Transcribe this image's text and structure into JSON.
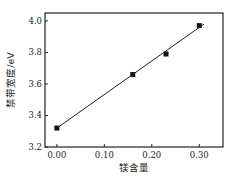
{
  "chart_data": {
    "type": "scatter",
    "title": "",
    "xlabel": "镁含量",
    "ylabel": "禁带宽度/eV",
    "xlim": [
      -0.025,
      0.35
    ],
    "ylim": [
      3.2,
      4.05
    ],
    "xticks": [
      0.0,
      0.1,
      0.2,
      0.3
    ],
    "xtick_labels": [
      "0.00",
      "0.10",
      "0.20",
      "0.30"
    ],
    "yticks": [
      3.2,
      3.4,
      3.6,
      3.8,
      4.0
    ],
    "ytick_labels": [
      "3.2",
      "3.4",
      "3.6",
      "3.8",
      "4.0"
    ],
    "grid": false,
    "legend": null,
    "series": [
      {
        "name": "measured",
        "marker": "square",
        "x": [
          0.0,
          0.16,
          0.23,
          0.3
        ],
        "y": [
          3.32,
          3.66,
          3.79,
          3.97
        ]
      },
      {
        "name": "linear fit",
        "style": "line",
        "x": [
          0.0,
          0.31
        ],
        "y": [
          3.32,
          3.98
        ]
      }
    ],
    "colors": {
      "marker": "#111111",
      "line": "#222222",
      "axis": "#222222"
    }
  }
}
